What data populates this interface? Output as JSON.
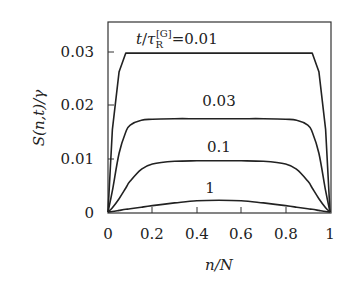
{
  "chart_data": {
    "type": "line",
    "title": "",
    "xlabel": "n/N",
    "ylabel": "S(n,t)/γ",
    "xlim": [
      0,
      1
    ],
    "ylim": [
      0,
      0.03
    ],
    "grid": false,
    "legend": "none (inline curve labels)",
    "x_ticks": [
      "0",
      "0.2",
      "0.4",
      "0.6",
      "0.8",
      "1"
    ],
    "y_ticks": [
      "0",
      "0.01",
      "0.02",
      "0.03"
    ],
    "annotation_prefix": "t/τ_R^[G] =",
    "x": [
      0,
      0.02,
      0.05,
      0.08,
      0.1,
      0.15,
      0.2,
      0.3,
      0.4,
      0.5,
      0.6,
      0.7,
      0.8,
      0.85,
      0.9,
      0.92,
      0.95,
      0.98,
      1.0
    ],
    "series": [
      {
        "name": "0.01",
        "label": "t/τ_R^[G] = 0.01",
        "values": [
          0,
          0.0155,
          0.0263,
          0.0298,
          0.0298,
          0.0298,
          0.0298,
          0.0298,
          0.0298,
          0.0298,
          0.0298,
          0.0298,
          0.0298,
          0.0298,
          0.0298,
          0.0298,
          0.0263,
          0.0155,
          0
        ]
      },
      {
        "name": "0.03",
        "label": "0.03",
        "values": [
          0,
          0.004,
          0.011,
          0.015,
          0.0163,
          0.0172,
          0.0174,
          0.0175,
          0.0175,
          0.0175,
          0.0175,
          0.0175,
          0.0174,
          0.0172,
          0.0163,
          0.015,
          0.011,
          0.004,
          0
        ]
      },
      {
        "name": "0.1",
        "label": "0.1",
        "values": [
          0,
          0.0008,
          0.0025,
          0.0045,
          0.0058,
          0.008,
          0.009,
          0.0095,
          0.0096,
          0.0096,
          0.0096,
          0.0095,
          0.009,
          0.008,
          0.0058,
          0.0045,
          0.0025,
          0.0008,
          0
        ]
      },
      {
        "name": "1",
        "label": "1",
        "values": [
          0,
          0.0001,
          0.0003,
          0.0005,
          0.0006,
          0.0009,
          0.0012,
          0.0017,
          0.0021,
          0.0022,
          0.0021,
          0.0017,
          0.0012,
          0.0009,
          0.0006,
          0.0005,
          0.0003,
          0.0001,
          0
        ]
      }
    ]
  },
  "labels": {
    "y_axis": "S(n,t)/γ",
    "x_axis": "n/N",
    "annotation_t": "t",
    "annotation_tau": "τ",
    "annotation_sub": "R",
    "annotation_sup": "[G]",
    "annotation_eq": "=0.01",
    "curve_003": "0.03",
    "curve_01": "0.1",
    "curve_1": "1"
  }
}
